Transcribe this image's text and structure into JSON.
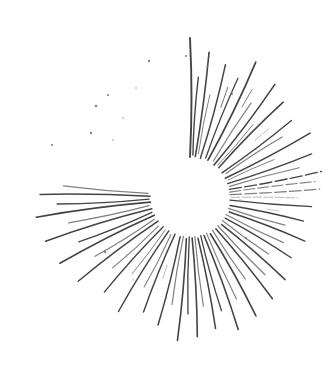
{
  "artwork": {
    "title": "Hand-drawn sunburst",
    "description": "Ink-style starburst illustration with radiating rays around an empty circular center",
    "medium": "pen and ink line drawing",
    "canvas": {
      "width": 329,
      "height": 371,
      "background_color": "#ffffff"
    },
    "center": {
      "x": 190,
      "y": 197,
      "void_radius": 38
    },
    "stroke": {
      "color": "#3c3c3c",
      "light_color": "#6e6e6e",
      "faint_color": "#9a9a9a",
      "min_width": 0.7,
      "max_width": 2.0
    },
    "ray_count": 64,
    "rays": [
      {
        "angle": -90.0,
        "inner": 40,
        "outer": 159,
        "width": 1.9,
        "tone": "dark",
        "bow": 3.0,
        "dash": "none"
      },
      {
        "angle": -86.0,
        "inner": 42,
        "outer": 120,
        "width": 1.4,
        "tone": "dark",
        "bow": -2.0,
        "dash": "none"
      },
      {
        "angle": -82.5,
        "inner": 41,
        "outer": 146,
        "width": 1.6,
        "tone": "dark",
        "bow": 2.0,
        "dash": "none"
      },
      {
        "angle": -79.0,
        "inner": 44,
        "outer": 104,
        "width": 1.0,
        "tone": "mid",
        "bow": -1.5,
        "dash": "none"
      },
      {
        "angle": -75.0,
        "inner": 40,
        "outer": 137,
        "width": 1.5,
        "tone": "dark",
        "bow": 2.5,
        "dash": "none"
      },
      {
        "angle": -71.0,
        "inner": 95,
        "outer": 116,
        "width": 1.1,
        "tone": "mid",
        "bow": 0,
        "dash": "short"
      },
      {
        "angle": -68.0,
        "inner": 42,
        "outer": 128,
        "width": 1.3,
        "tone": "dark",
        "bow": -2.0,
        "dash": "none"
      },
      {
        "angle": -64.0,
        "inner": 41,
        "outer": 150,
        "width": 1.7,
        "tone": "dark",
        "bow": 3.0,
        "dash": "none"
      },
      {
        "angle": -60.0,
        "inner": 104,
        "outer": 124,
        "width": 1.0,
        "tone": "mid",
        "bow": 0,
        "dash": "short"
      },
      {
        "angle": -57.0,
        "inner": 43,
        "outer": 112,
        "width": 1.2,
        "tone": "mid",
        "bow": -1.5,
        "dash": "none"
      },
      {
        "angle": -53.0,
        "inner": 40,
        "outer": 141,
        "width": 1.6,
        "tone": "dark",
        "bow": 2.5,
        "dash": "none"
      },
      {
        "angle": -49.0,
        "inner": 42,
        "outer": 96,
        "width": 1.0,
        "tone": "mid",
        "bow": 1.5,
        "dash": "none"
      },
      {
        "angle": -45.5,
        "inner": 41,
        "outer": 133,
        "width": 1.5,
        "tone": "dark",
        "bow": -2.5,
        "dash": "none"
      },
      {
        "angle": -41.0,
        "inner": 86,
        "outer": 104,
        "width": 0.9,
        "tone": "light",
        "bow": 0,
        "dash": "short"
      },
      {
        "angle": -37.0,
        "inner": 40,
        "outer": 127,
        "width": 1.4,
        "tone": "dark",
        "bow": 2.0,
        "dash": "none"
      },
      {
        "angle": -33.0,
        "inner": 43,
        "outer": 110,
        "width": 1.2,
        "tone": "mid",
        "bow": -1.8,
        "dash": "none"
      },
      {
        "angle": -28.0,
        "inner": 40,
        "outer": 136,
        "width": 1.5,
        "tone": "dark",
        "bow": 2.2,
        "dash": "none"
      },
      {
        "angle": -24.0,
        "inner": 42,
        "outer": 92,
        "width": 1.0,
        "tone": "mid",
        "bow": -1.2,
        "dash": "none"
      },
      {
        "angle": -19.5,
        "inner": 40,
        "outer": 129,
        "width": 1.4,
        "tone": "dark",
        "bow": 2.0,
        "dash": "none"
      },
      {
        "angle": -15.0,
        "inner": 41,
        "outer": 113,
        "width": 1.2,
        "tone": "mid",
        "bow": -1.5,
        "dash": "none"
      },
      {
        "angle": -11.0,
        "inner": 40,
        "outer": 134,
        "width": 1.3,
        "tone": "dark",
        "bow": 1.8,
        "dash": "fine"
      },
      {
        "angle": -7.0,
        "inner": 40,
        "outer": 126,
        "width": 1.1,
        "tone": "mid",
        "bow": -1.2,
        "dash": "fine"
      },
      {
        "angle": -3.5,
        "inner": 40,
        "outer": 130,
        "width": 1.2,
        "tone": "mid",
        "bow": 1.0,
        "dash": "fine"
      },
      {
        "angle": 0.5,
        "inner": 41,
        "outer": 108,
        "width": 1.0,
        "tone": "light",
        "bow": -1.0,
        "dash": "fine"
      },
      {
        "angle": 4.5,
        "inner": 40,
        "outer": 122,
        "width": 1.3,
        "tone": "dark",
        "bow": 1.5,
        "dash": "none"
      },
      {
        "angle": 9.0,
        "inner": 78,
        "outer": 90,
        "width": 0.8,
        "tone": "light",
        "bow": 0,
        "dash": "short"
      },
      {
        "angle": 12.0,
        "inner": 41,
        "outer": 116,
        "width": 1.4,
        "tone": "dark",
        "bow": -1.8,
        "dash": "none"
      },
      {
        "angle": 16.5,
        "inner": 40,
        "outer": 99,
        "width": 1.1,
        "tone": "mid",
        "bow": 1.4,
        "dash": "none"
      },
      {
        "angle": 21.0,
        "inner": 42,
        "outer": 123,
        "width": 1.5,
        "tone": "dark",
        "bow": -2.0,
        "dash": "none"
      },
      {
        "angle": 26.0,
        "inner": 40,
        "outer": 104,
        "width": 1.2,
        "tone": "mid",
        "bow": 1.6,
        "dash": "none"
      },
      {
        "angle": 31.0,
        "inner": 41,
        "outer": 118,
        "width": 1.4,
        "tone": "dark",
        "bow": -2.0,
        "dash": "none"
      },
      {
        "angle": 36.0,
        "inner": 40,
        "outer": 97,
        "width": 1.1,
        "tone": "mid",
        "bow": 1.3,
        "dash": "none"
      },
      {
        "angle": 41.0,
        "inner": 42,
        "outer": 126,
        "width": 1.5,
        "tone": "dark",
        "bow": -2.2,
        "dash": "none"
      },
      {
        "angle": 46.0,
        "inner": 40,
        "outer": 108,
        "width": 1.2,
        "tone": "mid",
        "bow": 1.5,
        "dash": "none"
      },
      {
        "angle": 51.0,
        "inner": 41,
        "outer": 131,
        "width": 1.5,
        "tone": "dark",
        "bow": -2.0,
        "dash": "none"
      },
      {
        "angle": 56.0,
        "inner": 40,
        "outer": 99,
        "width": 1.1,
        "tone": "mid",
        "bow": 1.4,
        "dash": "none"
      },
      {
        "angle": 61.0,
        "inner": 42,
        "outer": 136,
        "width": 1.6,
        "tone": "dark",
        "bow": -2.5,
        "dash": "none"
      },
      {
        "angle": 65.5,
        "inner": 40,
        "outer": 112,
        "width": 1.2,
        "tone": "mid",
        "bow": 1.6,
        "dash": "none"
      },
      {
        "angle": 70.0,
        "inner": 41,
        "outer": 141,
        "width": 1.6,
        "tone": "dark",
        "bow": -2.4,
        "dash": "none"
      },
      {
        "angle": 74.5,
        "inner": 40,
        "outer": 118,
        "width": 1.3,
        "tone": "dark",
        "bow": 1.8,
        "dash": "none"
      },
      {
        "angle": 79.0,
        "inner": 42,
        "outer": 134,
        "width": 1.5,
        "tone": "dark",
        "bow": -2.0,
        "dash": "none"
      },
      {
        "angle": 83.0,
        "inner": 40,
        "outer": 110,
        "width": 1.2,
        "tone": "mid",
        "bow": 1.4,
        "dash": "none"
      },
      {
        "angle": 87.0,
        "inner": 41,
        "outer": 140,
        "width": 1.6,
        "tone": "dark",
        "bow": -2.2,
        "dash": "none"
      },
      {
        "angle": 91.0,
        "inner": 40,
        "outer": 117,
        "width": 1.3,
        "tone": "dark",
        "bow": 1.6,
        "dash": "none"
      },
      {
        "angle": 95.0,
        "inner": 42,
        "outer": 144,
        "width": 1.6,
        "tone": "dark",
        "bow": -2.4,
        "dash": "none"
      },
      {
        "angle": 99.5,
        "inner": 40,
        "outer": 109,
        "width": 1.2,
        "tone": "mid",
        "bow": 1.5,
        "dash": "none"
      },
      {
        "angle": 104.0,
        "inner": 41,
        "outer": 132,
        "width": 1.5,
        "tone": "dark",
        "bow": -2.0,
        "dash": "none"
      },
      {
        "angle": 108.5,
        "inner": 72,
        "outer": 86,
        "width": 0.9,
        "tone": "light",
        "bow": 0,
        "dash": "short"
      },
      {
        "angle": 112.0,
        "inner": 40,
        "outer": 124,
        "width": 1.4,
        "tone": "dark",
        "bow": 2.0,
        "dash": "none"
      },
      {
        "angle": 117.0,
        "inner": 42,
        "outer": 101,
        "width": 1.1,
        "tone": "mid",
        "bow": -1.5,
        "dash": "none"
      },
      {
        "angle": 122.0,
        "inner": 40,
        "outer": 135,
        "width": 1.5,
        "tone": "dark",
        "bow": 2.4,
        "dash": "none"
      },
      {
        "angle": 127.0,
        "inner": 41,
        "outer": 96,
        "width": 1.0,
        "tone": "mid",
        "bow": -1.3,
        "dash": "none"
      },
      {
        "angle": 132.0,
        "inner": 40,
        "outer": 128,
        "width": 1.4,
        "tone": "dark",
        "bow": 2.2,
        "dash": "none"
      },
      {
        "angle": 137.5,
        "inner": 43,
        "outer": 105,
        "width": 1.1,
        "tone": "mid",
        "bow": -1.6,
        "dash": "none"
      },
      {
        "angle": 143.0,
        "inner": 40,
        "outer": 140,
        "width": 1.5,
        "tone": "dark",
        "bow": 2.6,
        "dash": "none"
      },
      {
        "angle": 148.0,
        "inner": 42,
        "outer": 112,
        "width": 1.2,
        "tone": "mid",
        "bow": -1.8,
        "dash": "none"
      },
      {
        "angle": 153.0,
        "inner": 40,
        "outer": 146,
        "width": 1.6,
        "tone": "dark",
        "bow": 2.8,
        "dash": "none"
      },
      {
        "angle": 158.0,
        "inner": 41,
        "outer": 120,
        "width": 1.3,
        "tone": "dark",
        "bow": -2.0,
        "dash": "none"
      },
      {
        "angle": 163.0,
        "inner": 40,
        "outer": 151,
        "width": 1.6,
        "tone": "dark",
        "bow": 3.0,
        "dash": "none"
      },
      {
        "angle": 168.0,
        "inner": 42,
        "outer": 124,
        "width": 1.3,
        "tone": "mid",
        "bow": -2.0,
        "dash": "none"
      },
      {
        "angle": 172.5,
        "inner": 40,
        "outer": 155,
        "width": 1.7,
        "tone": "dark",
        "bow": 2.6,
        "dash": "none"
      },
      {
        "angle": 177.0,
        "inner": 41,
        "outer": 133,
        "width": 1.4,
        "tone": "dark",
        "bow": -2.2,
        "dash": "none"
      },
      {
        "angle": 181.0,
        "inner": 40,
        "outer": 150,
        "width": 1.5,
        "tone": "dark",
        "bow": 2.0,
        "dash": "none"
      },
      {
        "angle": 185.0,
        "inner": 42,
        "outer": 127,
        "width": 1.3,
        "tone": "mid",
        "bow": -1.8,
        "dash": "none"
      }
    ],
    "speckles": [
      {
        "x": 96,
        "y": 106,
        "r": 1.3,
        "tone": "mid"
      },
      {
        "x": 108,
        "y": 95,
        "r": 1.1,
        "tone": "mid"
      },
      {
        "x": 123,
        "y": 118,
        "r": 1.0,
        "tone": "light"
      },
      {
        "x": 91,
        "y": 133,
        "r": 1.2,
        "tone": "mid"
      },
      {
        "x": 113,
        "y": 140,
        "r": 1.0,
        "tone": "light"
      },
      {
        "x": 52,
        "y": 145,
        "r": 1.1,
        "tone": "mid"
      },
      {
        "x": 136,
        "y": 88,
        "r": 1.0,
        "tone": "light"
      },
      {
        "x": 149,
        "y": 61,
        "r": 1.2,
        "tone": "mid"
      },
      {
        "x": 186,
        "y": 56,
        "r": 1.1,
        "tone": "mid"
      },
      {
        "x": 207,
        "y": 66,
        "r": 1.0,
        "tone": "light"
      },
      {
        "x": 232,
        "y": 94,
        "r": 1.1,
        "tone": "mid"
      },
      {
        "x": 105,
        "y": 252,
        "r": 1.2,
        "tone": "mid"
      },
      {
        "x": 133,
        "y": 280,
        "r": 1.0,
        "tone": "light"
      },
      {
        "x": 166,
        "y": 298,
        "r": 1.1,
        "tone": "mid"
      },
      {
        "x": 240,
        "y": 200,
        "r": 1.0,
        "tone": "light"
      },
      {
        "x": 246,
        "y": 238,
        "r": 1.1,
        "tone": "mid"
      }
    ]
  }
}
